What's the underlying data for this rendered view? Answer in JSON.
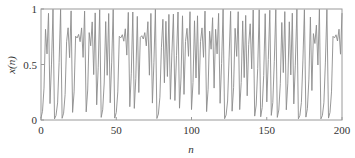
{
  "chart_data": {
    "type": "line",
    "title": "",
    "xlabel": "n",
    "ylabel": "x(n)",
    "xlim": [
      0,
      200
    ],
    "ylim": [
      0,
      1
    ],
    "xticks": [
      0,
      50,
      100,
      150,
      200
    ],
    "xtick_labels": [
      "0",
      "50",
      "100",
      "150",
      "200"
    ],
    "yticks": [
      0,
      0.5,
      1
    ],
    "ytick_labels": [
      "0",
      "0.5",
      "1"
    ],
    "grid": false,
    "legend": null,
    "line_color": "#8c8c8c",
    "series": [
      {
        "name": "x(n)",
        "generator": "logistic map x(n+1)=r*x(n)*(1-x(n))",
        "r": 3.99,
        "x0": 0.02,
        "n_points": 201
      }
    ]
  }
}
